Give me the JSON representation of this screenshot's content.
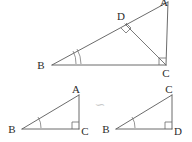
{
  "figure": {
    "background_color": "#ffffff",
    "stroke_color": "#5a5a5a",
    "label_color": "#2b2b2b",
    "similarity_symbol_color": "#c9c9c9",
    "similarity_symbol": "∽",
    "top_triangle": {
      "name": "triangle-abc-with-altitude",
      "vertices": [
        {
          "id": "A",
          "label": "A",
          "x": 168,
          "y": 2,
          "label_x": 164,
          "label_y": 5
        },
        {
          "id": "B",
          "label": "B",
          "x": 52,
          "y": 65,
          "label_x": 38,
          "label_y": 68
        },
        {
          "id": "C",
          "label": "C",
          "x": 166,
          "y": 65,
          "label_x": 162,
          "label_y": 77
        },
        {
          "id": "D",
          "label": "D",
          "x": 125,
          "y": 24,
          "label_x": 118,
          "label_y": 19
        }
      ],
      "edges": [
        {
          "from": "B",
          "to": "A"
        },
        {
          "from": "B",
          "to": "C"
        },
        {
          "from": "C",
          "to": "A"
        }
      ],
      "altitude": {
        "from": "C",
        "to": "D"
      },
      "right_angles": [
        "C",
        "D"
      ],
      "angle_arcs_at_B": 2
    },
    "bottom_left_triangle": {
      "name": "triangle-abc",
      "vertices": [
        {
          "id": "A",
          "label": "A",
          "x": 79,
          "y": 95,
          "label_x": 74,
          "label_y": 92
        },
        {
          "id": "B",
          "label": "B",
          "x": 22,
          "y": 129,
          "label_x": 9,
          "label_y": 132
        },
        {
          "id": "C",
          "label": "C",
          "x": 79,
          "y": 129,
          "label_x": 81,
          "label_y": 136
        }
      ],
      "edges": [
        {
          "from": "B",
          "to": "A"
        },
        {
          "from": "B",
          "to": "C"
        },
        {
          "from": "C",
          "to": "A"
        }
      ],
      "right_angles": [
        "C"
      ],
      "angle_arcs_at_B": 1
    },
    "bottom_right_triangle": {
      "name": "triangle-cbd",
      "vertices": [
        {
          "id": "C",
          "label": "C",
          "x": 172,
          "y": 95,
          "label_x": 167,
          "label_y": 92
        },
        {
          "id": "B",
          "label": "B",
          "x": 116,
          "y": 129,
          "label_x": 103,
          "label_y": 132
        },
        {
          "id": "D",
          "label": "D",
          "x": 172,
          "y": 129,
          "label_x": 174,
          "label_y": 136
        }
      ],
      "edges": [
        {
          "from": "B",
          "to": "C"
        },
        {
          "from": "B",
          "to": "D"
        },
        {
          "from": "D",
          "to": "C"
        }
      ],
      "right_angles": [
        "D"
      ],
      "angle_arcs_at_B": 1
    }
  }
}
